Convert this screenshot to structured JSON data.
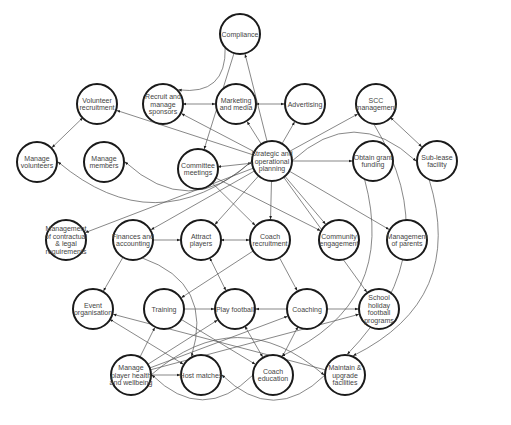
{
  "diagram": {
    "type": "network-graph",
    "node_radius": 20,
    "colors": {
      "node_stroke": "#1a1a1a",
      "node_fill": "#ffffff",
      "edge": "#555555",
      "text": "#444444"
    },
    "nodes": [
      {
        "id": "compliance",
        "lines": [
          "Compliance"
        ],
        "x": 240,
        "y": 34
      },
      {
        "id": "volunteer-recruitment",
        "lines": [
          "Volunteer",
          "recruitment"
        ],
        "x": 97,
        "y": 104
      },
      {
        "id": "recruit-sponsors",
        "lines": [
          "Recruit and",
          "manage",
          "sponsors"
        ],
        "x": 163,
        "y": 104
      },
      {
        "id": "marketing-media",
        "lines": [
          "Marketing",
          "and media"
        ],
        "x": 236,
        "y": 104
      },
      {
        "id": "advertising",
        "lines": [
          "Advertising"
        ],
        "x": 305,
        "y": 104
      },
      {
        "id": "scc-management",
        "lines": [
          "SCC",
          "management"
        ],
        "x": 376,
        "y": 104
      },
      {
        "id": "manage-volunteers",
        "lines": [
          "Manage",
          "volunteers"
        ],
        "x": 37,
        "y": 162
      },
      {
        "id": "manage-members",
        "lines": [
          "Manage",
          "members"
        ],
        "x": 104,
        "y": 162
      },
      {
        "id": "committee-meetings",
        "lines": [
          "Committee",
          "meetings"
        ],
        "x": 198,
        "y": 169
      },
      {
        "id": "strategic-planning",
        "lines": [
          "Strategic and",
          "operational",
          "planning"
        ],
        "x": 272,
        "y": 161
      },
      {
        "id": "obtain-grant",
        "lines": [
          "Obtain grant",
          "funding"
        ],
        "x": 373,
        "y": 161
      },
      {
        "id": "sub-lease",
        "lines": [
          "Sub-lease",
          "facility"
        ],
        "x": 437,
        "y": 161
      },
      {
        "id": "contractual-legal",
        "lines": [
          "Management",
          "of contractual",
          "& legal",
          "requirements"
        ],
        "x": 66,
        "y": 240
      },
      {
        "id": "finances",
        "lines": [
          "Finances and",
          "accounting"
        ],
        "x": 133,
        "y": 240
      },
      {
        "id": "attract-players",
        "lines": [
          "Attract",
          "players"
        ],
        "x": 201,
        "y": 240
      },
      {
        "id": "coach-recruitment",
        "lines": [
          "Coach",
          "recruitment"
        ],
        "x": 270,
        "y": 240
      },
      {
        "id": "community-engagement",
        "lines": [
          "Community",
          "engagement"
        ],
        "x": 339,
        "y": 240
      },
      {
        "id": "management-parents",
        "lines": [
          "Management",
          "of parents"
        ],
        "x": 407,
        "y": 240
      },
      {
        "id": "event-organisation",
        "lines": [
          "Event",
          "organisation"
        ],
        "x": 93,
        "y": 309
      },
      {
        "id": "training",
        "lines": [
          "Training"
        ],
        "x": 164,
        "y": 309
      },
      {
        "id": "play-football",
        "lines": [
          "Play football"
        ],
        "x": 235,
        "y": 309
      },
      {
        "id": "coaching",
        "lines": [
          "Coaching"
        ],
        "x": 307,
        "y": 309
      },
      {
        "id": "school-holiday",
        "lines": [
          "School",
          "holiday",
          "football",
          "programs"
        ],
        "x": 379,
        "y": 309
      },
      {
        "id": "player-health",
        "lines": [
          "Manage",
          "player health",
          "and wellbeing"
        ],
        "x": 131,
        "y": 375
      },
      {
        "id": "host-matches",
        "lines": [
          "Host matches"
        ],
        "x": 201,
        "y": 375
      },
      {
        "id": "coach-education",
        "lines": [
          "Coach",
          "education"
        ],
        "x": 273,
        "y": 375
      },
      {
        "id": "maintain-facilities",
        "lines": [
          "Maintain &",
          "upgrade",
          "facilities"
        ],
        "x": 345,
        "y": 375
      }
    ],
    "edges": [
      {
        "from": "volunteer-recruitment",
        "to": "manage-volunteers",
        "bidirectional": true
      },
      {
        "from": "recruit-sponsors",
        "to": "marketing-media",
        "bidirectional": true
      },
      {
        "from": "marketing-media",
        "to": "advertising",
        "bidirectional": true
      },
      {
        "from": "committee-meetings",
        "to": "strategic-planning",
        "bidirectional": true
      },
      {
        "from": "strategic-planning",
        "to": "obtain-grant"
      },
      {
        "from": "scc-management",
        "to": "sub-lease",
        "bidirectional": true
      },
      {
        "from": "strategic-planning",
        "to": "compliance"
      },
      {
        "from": "compliance",
        "to": "committee-meetings"
      },
      {
        "from": "strategic-planning",
        "to": "marketing-media"
      },
      {
        "from": "strategic-planning",
        "to": "advertising"
      },
      {
        "from": "strategic-planning",
        "to": "scc-management"
      },
      {
        "from": "strategic-planning",
        "to": "sub-lease",
        "curve": true
      },
      {
        "from": "strategic-planning",
        "to": "volunteer-recruitment"
      },
      {
        "from": "strategic-planning",
        "to": "recruit-sponsors"
      },
      {
        "from": "strategic-planning",
        "to": "manage-volunteers",
        "curve": true
      },
      {
        "from": "strategic-planning",
        "to": "manage-members",
        "curve": true
      },
      {
        "from": "strategic-planning",
        "to": "coach-recruitment"
      },
      {
        "from": "strategic-planning",
        "to": "community-engagement"
      },
      {
        "from": "strategic-planning",
        "to": "management-parents"
      },
      {
        "from": "strategic-planning",
        "to": "school-holiday"
      },
      {
        "from": "strategic-planning",
        "to": "finances"
      },
      {
        "from": "strategic-planning",
        "to": "contractual-legal"
      },
      {
        "from": "strategic-planning",
        "to": "attract-players"
      },
      {
        "from": "committee-meetings",
        "to": "coach-recruitment"
      },
      {
        "from": "committee-meetings",
        "to": "community-engagement"
      },
      {
        "from": "finances",
        "to": "attract-players"
      },
      {
        "from": "attract-players",
        "to": "coach-recruitment",
        "bidirectional": true
      },
      {
        "from": "attract-players",
        "to": "play-football",
        "bidirectional": true
      },
      {
        "from": "coach-recruitment",
        "to": "coaching"
      },
      {
        "from": "coach-recruitment",
        "to": "training"
      },
      {
        "from": "training",
        "to": "play-football"
      },
      {
        "from": "coaching",
        "to": "play-football"
      },
      {
        "from": "coaching",
        "to": "school-holiday"
      },
      {
        "from": "coaching",
        "to": "coach-education",
        "bidirectional": true
      },
      {
        "from": "play-football",
        "to": "coach-education",
        "bidirectional": true
      },
      {
        "from": "player-health",
        "to": "host-matches"
      },
      {
        "from": "player-health",
        "to": "training"
      },
      {
        "from": "player-health",
        "to": "play-football"
      },
      {
        "from": "player-health",
        "to": "coaching"
      },
      {
        "from": "player-health",
        "to": "school-holiday"
      },
      {
        "from": "finances",
        "to": "event-organisation"
      },
      {
        "from": "event-organisation",
        "to": "host-matches",
        "bidirectional": true
      },
      {
        "from": "maintain-facilities",
        "to": "event-organisation"
      },
      {
        "from": "training",
        "to": "coach-education"
      },
      {
        "from": "coach-education",
        "to": "player-health",
        "curve": true
      },
      {
        "from": "maintain-facilities",
        "to": "host-matches",
        "curve": true
      },
      {
        "from": "player-health",
        "to": "maintain-facilities",
        "curve": true
      },
      {
        "from": "scc-management",
        "to": "maintain-facilities",
        "curve": true
      },
      {
        "from": "sub-lease",
        "to": "maintain-facilities",
        "curve": true
      },
      {
        "from": "obtain-grant",
        "to": "coach-education",
        "curve": true
      },
      {
        "from": "compliance",
        "to": "recruit-sponsors",
        "curve": true
      },
      {
        "from": "finances",
        "to": "host-matches",
        "curve": true
      }
    ]
  }
}
